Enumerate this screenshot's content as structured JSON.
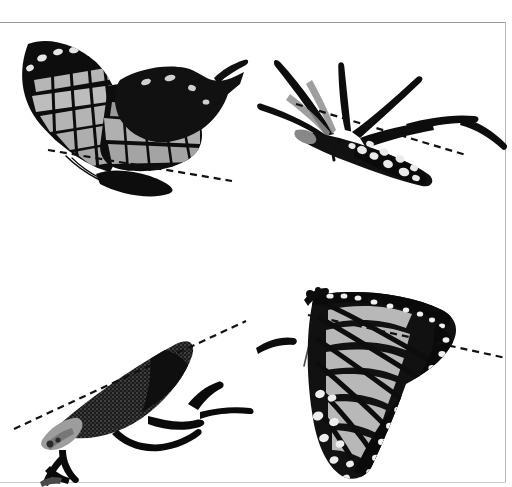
{
  "figure": {
    "title": "Butterfly resting postures with body-axis reference lines",
    "background_color": "#ffffff",
    "width": 512,
    "height": 487,
    "frame": {
      "top_rule_color": "#9a9a9a",
      "right_rule_color": "#b5b5b5",
      "bottom_rule_color": "#cfcfcf"
    },
    "layout": "2x2 grid of photographic panels, no captions or axis text"
  },
  "palette": {
    "wing_black": "#0d0d0d",
    "wing_dark": "#1a1a1a",
    "wing_mid_gray": "#8d8d8d",
    "wing_light_gray": "#b9b9b9",
    "wing_pale": "#d8d8d8",
    "spot_white": "#f2f2f2",
    "dashed_line": "#111111",
    "body_speckle": "#3a3a3a",
    "leg_black": "#0a0a0a"
  },
  "panels": [
    {
      "id": "panel-top-left",
      "name": "swallowtail-lateral-wings-up",
      "subject": "swallowtail butterfly, lateral view, wings raised, banded pale stripes",
      "position": {
        "x": 0,
        "y": 22,
        "width": 256,
        "height": 222
      },
      "dashed_line": {
        "label": "body-axis-reference-line",
        "x1": 48,
        "y1": 150,
        "x2": 232,
        "y2": 181,
        "dash": "7 5",
        "width": 2.2
      }
    },
    {
      "id": "panel-top-right",
      "name": "butterfly-wings-closed-legs-extended",
      "subject": "butterfly with wings folded back, long legs and antennae extended, spotted abdomen",
      "position": {
        "x": 256,
        "y": 22,
        "width": 256,
        "height": 222
      },
      "dashed_line": {
        "label": "body-axis-reference-line",
        "x1": 296,
        "y1": 104,
        "x2": 466,
        "y2": 155,
        "dash": "7 5",
        "width": 2.2
      }
    },
    {
      "id": "panel-bottom-left",
      "name": "butterfly-thorax-speckled-legs",
      "subject": "butterfly body and speckled wing base angled upward with splayed legs",
      "position": {
        "x": 0,
        "y": 244,
        "width": 256,
        "height": 238
      },
      "dashed_line": {
        "label": "body-axis-reference-line",
        "x1": 14,
        "y1": 429,
        "x2": 246,
        "y2": 321,
        "dash": "7 5",
        "width": 2.2
      }
    },
    {
      "id": "panel-bottom-right",
      "name": "monarch-wing-hanging",
      "subject": "monarch butterfly hanging, forewing and hindwing with veins and white marginal spots",
      "position": {
        "x": 256,
        "y": 244,
        "width": 256,
        "height": 238
      },
      "dashed_line": {
        "label": "body-axis-reference-line",
        "x1": 308,
        "y1": 315,
        "x2": 506,
        "y2": 358,
        "dash": "7 5",
        "width": 2.2
      }
    }
  ]
}
